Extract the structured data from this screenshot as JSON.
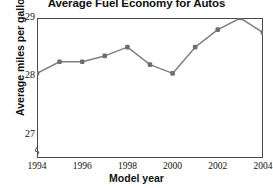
{
  "chart_data": {
    "type": "line",
    "title": "Average Fuel Economy for Autos",
    "xlabel": "Model year",
    "ylabel": "Average miles per gallon",
    "x": [
      1994,
      1995,
      1996,
      1997,
      1998,
      1999,
      2000,
      2001,
      2002,
      2003,
      2004
    ],
    "values": [
      28.05,
      28.25,
      28.25,
      28.35,
      28.5,
      28.2,
      28.05,
      28.5,
      28.8,
      29.0,
      28.75
    ],
    "series": [
      {
        "name": "Average miles per gallon",
        "values": [
          28.05,
          28.25,
          28.25,
          28.35,
          28.5,
          28.2,
          28.05,
          28.5,
          28.8,
          29.0,
          28.75
        ]
      }
    ],
    "xlim": [
      1994,
      2004
    ],
    "ylim": [
      26.6,
      29.0
    ],
    "ytick_labels": [
      "29",
      "28",
      "27"
    ],
    "ytick_values": [
      29,
      28,
      27
    ],
    "xtick_labels": [
      "1994",
      "1996",
      "1998",
      "2000",
      "2002",
      "2004"
    ],
    "xtick_values": [
      1994,
      1996,
      1998,
      2000,
      2002,
      2004
    ],
    "grid": true,
    "grid_minor_step": 0.2,
    "legend": "none",
    "axis_break": true,
    "line_color": "#808080",
    "marker_color": "#6e6e6e",
    "grid_color": "#b8b8b8",
    "frame_color": "#4a4a4a"
  }
}
